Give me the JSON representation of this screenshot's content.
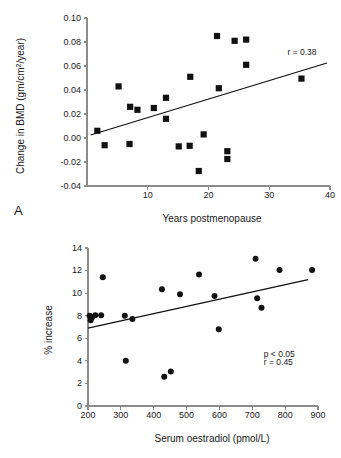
{
  "figure": {
    "panel_a_label": "A",
    "panel_b_label": "B"
  },
  "chart_data": [
    {
      "id": "panel-a",
      "type": "scatter",
      "title": "",
      "xlabel": "Years postmenopause",
      "ylabel": "Change in BMD (gm/cm²/year)",
      "ylabel_parts": {
        "pre": "Change in BMD (gm/cm",
        "sup": "2",
        "post": "/year)"
      },
      "xlim": [
        0,
        40
      ],
      "ylim": [
        -0.04,
        0.1
      ],
      "xticks": [
        10,
        20,
        30,
        40
      ],
      "xtick_labels": [
        "10",
        "20",
        "30",
        "40"
      ],
      "yticks": [
        -0.04,
        -0.02,
        0.0,
        0.02,
        0.04,
        0.06,
        0.08,
        0.1
      ],
      "ytick_labels": [
        "-0.04",
        "-0.02",
        "0.00",
        "0.02",
        "0.04",
        "0.06",
        "0.08",
        "0.10"
      ],
      "grid": false,
      "marker": "square",
      "annotations": [
        {
          "text": "r = 0.38",
          "x": 33.0,
          "y": 0.0695
        }
      ],
      "fit_line": {
        "x0": 0.6,
        "y0": 0.0025,
        "x1": 39.5,
        "y1": 0.0625
      },
      "points": [
        {
          "x": 1.7,
          "y": 0.006
        },
        {
          "x": 2.9,
          "y": -0.006
        },
        {
          "x": 5.2,
          "y": 0.043
        },
        {
          "x": 7.1,
          "y": 0.026
        },
        {
          "x": 7.0,
          "y": -0.005
        },
        {
          "x": 8.3,
          "y": 0.0235
        },
        {
          "x": 11.0,
          "y": 0.025
        },
        {
          "x": 13.0,
          "y": 0.0335
        },
        {
          "x": 13.0,
          "y": 0.016
        },
        {
          "x": 15.1,
          "y": -0.007
        },
        {
          "x": 16.9,
          "y": -0.0065
        },
        {
          "x": 17.0,
          "y": 0.051
        },
        {
          "x": 18.4,
          "y": -0.0275
        },
        {
          "x": 19.2,
          "y": 0.003
        },
        {
          "x": 21.4,
          "y": 0.085
        },
        {
          "x": 21.7,
          "y": 0.0415
        },
        {
          "x": 23.1,
          "y": -0.011
        },
        {
          "x": 23.1,
          "y": -0.0175
        },
        {
          "x": 24.3,
          "y": 0.081
        },
        {
          "x": 26.2,
          "y": 0.082
        },
        {
          "x": 26.2,
          "y": 0.061
        },
        {
          "x": 35.3,
          "y": 0.0495
        }
      ]
    },
    {
      "id": "panel-b",
      "type": "scatter",
      "title": "",
      "xlabel": "Serum oestradiol (pmol/L)",
      "ylabel": "% increase",
      "xlim": [
        200,
        900
      ],
      "ylim": [
        0,
        14
      ],
      "xticks": [
        200,
        300,
        400,
        500,
        600,
        700,
        800,
        900
      ],
      "xtick_labels": [
        "200",
        "300",
        "400",
        "500",
        "600",
        "700",
        "800",
        "900"
      ],
      "yticks": [
        0,
        2,
        4,
        6,
        8,
        10,
        12,
        14
      ],
      "ytick_labels": [
        "0",
        "2",
        "4",
        "6",
        "8",
        "10",
        "12",
        "14"
      ],
      "grid": false,
      "marker": "circle",
      "annotations": [
        {
          "text": "p < 0.05",
          "x": 735,
          "y": 4.35
        },
        {
          "text": "r = 0.45",
          "x": 735,
          "y": 3.65
        }
      ],
      "fit_line": {
        "x0": 200,
        "y0": 6.9,
        "x1": 870,
        "y1": 11.2
      },
      "points": [
        {
          "x": 205,
          "y": 8.0
        },
        {
          "x": 208,
          "y": 7.6
        },
        {
          "x": 212,
          "y": 7.85
        },
        {
          "x": 222,
          "y": 8.05
        },
        {
          "x": 240,
          "y": 8.05
        },
        {
          "x": 245,
          "y": 11.4
        },
        {
          "x": 312,
          "y": 8.0
        },
        {
          "x": 315,
          "y": 4.0
        },
        {
          "x": 335,
          "y": 7.7
        },
        {
          "x": 425,
          "y": 10.35
        },
        {
          "x": 432,
          "y": 2.6
        },
        {
          "x": 452,
          "y": 3.05
        },
        {
          "x": 480,
          "y": 9.9
        },
        {
          "x": 538,
          "y": 11.65
        },
        {
          "x": 585,
          "y": 9.75
        },
        {
          "x": 598,
          "y": 6.8
        },
        {
          "x": 710,
          "y": 13.05
        },
        {
          "x": 715,
          "y": 9.55
        },
        {
          "x": 728,
          "y": 8.7
        },
        {
          "x": 783,
          "y": 12.05
        },
        {
          "x": 882,
          "y": 12.05
        }
      ]
    }
  ]
}
